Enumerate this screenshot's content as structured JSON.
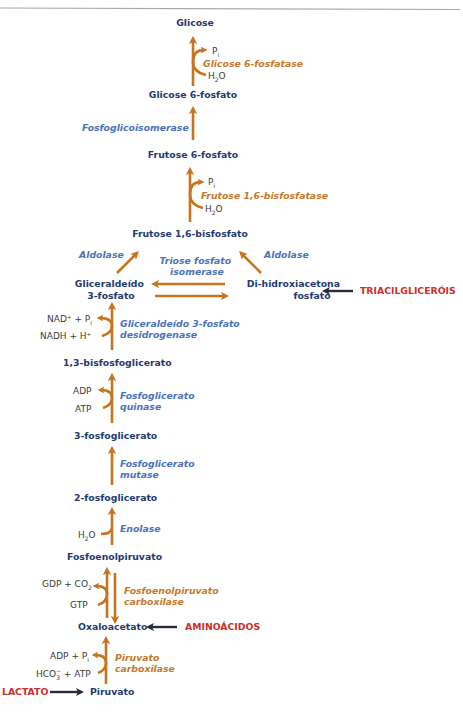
{
  "diagram": {
    "colors": {
      "metabolite": "#1f3a6e",
      "enzyme_blue": "#4a74b8",
      "enzyme_orange": "#c47a2c",
      "arrow": "#c8741e",
      "source": "#c9302c",
      "source_arrow": "#2a2a3a",
      "cofactor": "#3a3a3a"
    },
    "metabolites": {
      "glicose": "Glicose",
      "glicose6p": "Glicose 6-fosfato",
      "frutose6p": "Frutose 6-fosfato",
      "frutose16bp": "Frutose 1,6-bisfosfato",
      "gliceraldeido_l1": "Gliceraldeído",
      "gliceraldeido_l2": "3-fosfato",
      "dhap_l1": "Di-hidroxiacetona",
      "dhap_l2": "fosfato",
      "bpg13": "1,3-bisfosfoglicerato",
      "pg3": "3-fosfoglicerato",
      "pg2": "2-fosfoglicerato",
      "pep": "Fosfoenolpiruvato",
      "oxaloacetato": "Oxaloacetato",
      "piruvato": "Piruvato"
    },
    "enzymes": {
      "glicose6fosfatase": "Glicose 6-fosfatase",
      "fosfoglicoisomerase": "Fosfoglicoisomerase",
      "frutose16bisfosfatase": "Frutose 1,6-bisfosfatase",
      "aldolase_left": "Aldolase",
      "aldolase_right": "Aldolase",
      "triose_l1": "Triose fosfato",
      "triose_l2": "isomerase",
      "g3pdh_l1": "Gliceraldeído 3-fosfato",
      "g3pdh_l2": "desidrogenase",
      "pgk_l1": "Fosfoglicerato",
      "pgk_l2": "quinase",
      "pgm_l1": "Fosfoglicerato",
      "pgm_l2": "mutase",
      "enolase": "Enolase",
      "pepck_l1": "Fosfoenolpiruvato",
      "pepck_l2": "carboxilase",
      "pc_l1": "Piruvato",
      "pc_l2": "carboxilase"
    },
    "cofactors": {
      "g6pase_out": "P",
      "g6pase_out_sub": "i",
      "g6pase_in": "H",
      "g6pase_in_sub": "2",
      "g6pase_in_tail": "O",
      "fbpase_out": "P",
      "fbpase_out_sub": "i",
      "fbpase_in": "H",
      "fbpase_in_sub": "2",
      "fbpase_in_tail": "O",
      "g3pdh_out": "NAD⁺ + P",
      "g3pdh_out_sub": "i",
      "g3pdh_in": "NADH + H⁺",
      "pgk_out": "ADP",
      "pgk_in": "ATP",
      "enolase_in": "H",
      "enolase_in_sub": "2",
      "enolase_in_tail": "O",
      "pepck_out": "GDP + CO",
      "pepck_out_sub": "2",
      "pepck_in": "GTP",
      "pc_out": "ADP + P",
      "pc_out_sub": "i",
      "pc_in": "HCO",
      "pc_in_sub": "3",
      "pc_in_sup": "−",
      "pc_in_tail": " + ATP"
    },
    "sources": {
      "triacilglicerois": "TRIACILGLICERÓIS",
      "aminoacidos": "AMINOÁCIDOS",
      "lactato": "LACTATO"
    }
  }
}
